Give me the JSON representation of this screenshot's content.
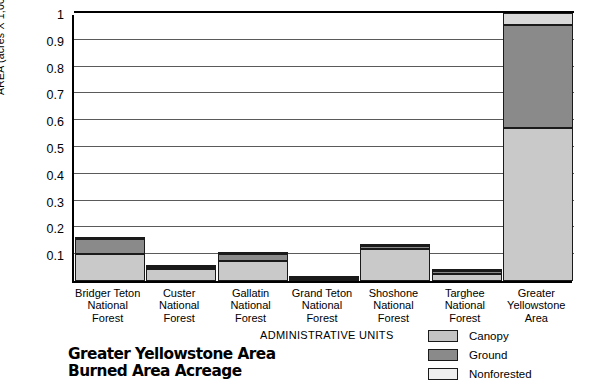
{
  "chart_data": {
    "type": "bar",
    "title_line1": "Greater Yellowstone Area",
    "title_line2": "Burned Area Acreage",
    "xlabel": "ADMINISTRATIVE UNITS",
    "ylabel": "AREA (acres X 1,000,000)",
    "stacked": true,
    "grid": true,
    "legend_position": "bottom-right",
    "ylim": [
      0,
      1
    ],
    "yticks": [
      0.1,
      0.2,
      0.3,
      0.4,
      0.5,
      0.6,
      0.7,
      0.8,
      0.9,
      1
    ],
    "ytick_labels": [
      "0.1",
      "0.2",
      "0.3",
      "0.4",
      "0.5",
      "0.6",
      "0.7",
      "0.8",
      "0.9",
      "1"
    ],
    "categories": [
      "Bridger Teton\nNational\nForest",
      "Custer\nNational\nForest",
      "Gallatin\nNational\nForest",
      "Grand Teton\nNational\nForest",
      "Shoshone\nNational\nForest",
      "Targhee\nNational\nForest",
      "Greater\nYellowstone\nArea"
    ],
    "series": [
      {
        "name": "Nonforested",
        "color": "#c9c9c9",
        "values": [
          0.1,
          0.045,
          0.075,
          0.008,
          0.118,
          0.026,
          0.57
        ]
      },
      {
        "name": "Ground",
        "color": "#8a8a8a",
        "values": [
          0.055,
          0.006,
          0.024,
          0.003,
          0.014,
          0.01,
          0.385
        ]
      },
      {
        "name": "Canopy",
        "color": "#d8d8d8",
        "values": [
          0.01,
          0.002,
          0.004,
          0.001,
          0.003,
          0.002,
          0.045
        ]
      }
    ],
    "legend": [
      {
        "label": "Canopy",
        "color": "#c4c4c4"
      },
      {
        "label": "Ground",
        "color": "#8a8a8a"
      },
      {
        "label": "Nonforested",
        "color": "#efefef"
      }
    ]
  }
}
